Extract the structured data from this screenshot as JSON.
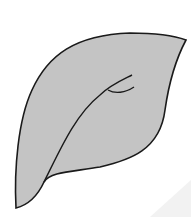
{
  "figure": {
    "colors": {
      "background": "#ffffff",
      "fill": "#c4c4c4",
      "stroke": "#1a1a1a",
      "glare": "#f0f0f0"
    }
  }
}
